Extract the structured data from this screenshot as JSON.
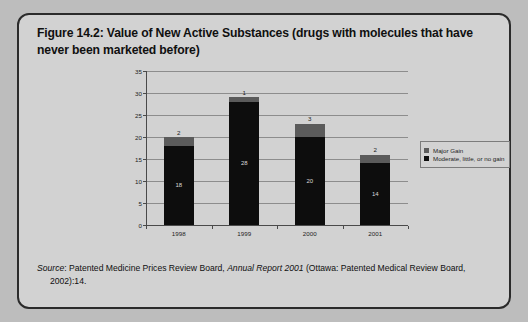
{
  "figure": {
    "title": "Figure 14.2: Value of New Active Substances (drugs with molecules that have never been marketed before)",
    "source": {
      "source_word": "Source",
      "text_before_italic": ": Patented Medicine Prices Review Board, ",
      "italic_title": "Annual Report 2001",
      "text_after_italic": " (Ottawa: Patented Medical Review Board, 2002):14."
    }
  },
  "chart_data": {
    "type": "bar",
    "subtype": "stacked",
    "title": "",
    "xlabel": "",
    "ylabel": "",
    "categories": [
      "1998",
      "1999",
      "2000",
      "2001"
    ],
    "ylim": [
      0,
      35
    ],
    "ytick_step": 5,
    "yticks": [
      "35",
      "30",
      "25",
      "20",
      "15",
      "10",
      "5",
      "0"
    ],
    "grid": true,
    "legend_position": "right",
    "series": [
      {
        "name": "Major Gain",
        "color": "#5b5b5b",
        "values": [
          2,
          1,
          3,
          2
        ],
        "labels": [
          "2",
          "1",
          "3",
          "2"
        ]
      },
      {
        "name": "Moderate, little, or no gain",
        "color": "#0d0d0d",
        "values": [
          18,
          28,
          20,
          14
        ],
        "labels": [
          "18",
          "28",
          "20",
          "14"
        ]
      }
    ],
    "totals": [
      20,
      29,
      23,
      16
    ]
  },
  "legend": {
    "items": [
      {
        "label": "Major Gain",
        "color": "#5b5b5b"
      },
      {
        "label": "Moderate, little, or no gain",
        "color": "#0d0d0d"
      }
    ]
  }
}
